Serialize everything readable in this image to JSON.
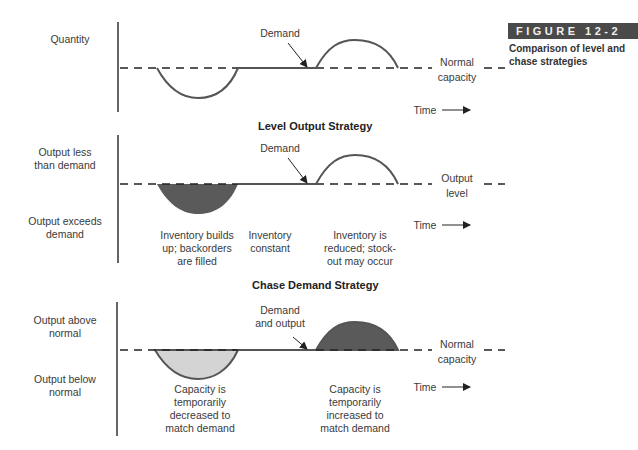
{
  "figure": {
    "tag": "FIGURE 12-2",
    "caption": "Comparison of level and chase strategies"
  },
  "panel1": {
    "y_label": "Quantity",
    "demand_label": "Demand",
    "line_label_1": "Normal",
    "line_label_2": "capacity",
    "time_label": "Time"
  },
  "panel2": {
    "title": "Level Output Strategy",
    "y_label_top_1": "Output less",
    "y_label_top_2": "than demand",
    "y_label_bottom_1": "Output exceeds",
    "y_label_bottom_2": "demand",
    "demand_label": "Demand",
    "line_label_1": "Output",
    "line_label_2": "level",
    "time_label": "Time",
    "note_dip_1": "Inventory builds",
    "note_dip_2": "up; backorders",
    "note_dip_3": "are filled",
    "note_flat_1": "Inventory",
    "note_flat_2": "constant",
    "note_bump_1": "Inventory is",
    "note_bump_2": "reduced; stock-",
    "note_bump_3": "out may occur"
  },
  "panel3": {
    "title": "Chase Demand Strategy",
    "y_label_top_1": "Output above",
    "y_label_top_2": "normal",
    "y_label_bottom_1": "Output below",
    "y_label_bottom_2": "normal",
    "demand_label_1": "Demand",
    "demand_label_2": "and output",
    "line_label_1": "Normal",
    "line_label_2": "capacity",
    "time_label": "Time",
    "note_dip_1": "Capacity is",
    "note_dip_2": "temporarily",
    "note_dip_3": "decreased to",
    "note_dip_4": "match demand",
    "note_bump_1": "Capacity is",
    "note_bump_2": "temporarily",
    "note_bump_3": "increased to",
    "note_bump_4": "match demand"
  },
  "colors": {
    "fill_dark": "#5a5a5a",
    "fill_light": "#d4d4d4",
    "line": "#444444",
    "tag_bg": "#4a4a4a"
  }
}
